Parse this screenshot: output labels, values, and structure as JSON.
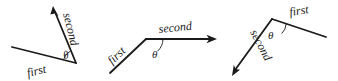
{
  "figure": {
    "stroke_color": "#1a1a1a",
    "background_color": "#ffffff",
    "label_first": "first",
    "label_second": "second",
    "label_theta": "θ"
  },
  "diagrams": [
    {
      "id": "left",
      "name": "acute-angle-opening-counterclockwise",
      "vertex": [
        76,
        63
      ],
      "first_arm_end": [
        12,
        47
      ],
      "second_arm_end": [
        53,
        7
      ],
      "second_has_arrow": true,
      "first_has_arrow": false,
      "first_label": "first",
      "second_label": "second",
      "theta_label": "θ",
      "first_label_rotation": -14,
      "second_label_rotation": -76,
      "theta_position": [
        64,
        57
      ]
    },
    {
      "id": "middle",
      "name": "obtuse-angle-opening-right",
      "vertex": [
        146,
        39
      ],
      "first_arm_end": [
        110,
        73
      ],
      "second_arm_end": [
        216,
        39
      ],
      "second_has_arrow": true,
      "first_has_arrow": false,
      "first_label": "first",
      "second_label": "second",
      "theta_label": "θ",
      "first_label_rotation": -43,
      "second_label_rotation": -6,
      "theta_position": [
        155,
        55
      ]
    },
    {
      "id": "right",
      "name": "obtuse-angle-opening-downward",
      "vertex": [
        272,
        19
      ],
      "first_arm_end": [
        326,
        37
      ],
      "second_arm_end": [
        233,
        75
      ],
      "second_has_arrow": true,
      "first_has_arrow": false,
      "first_label": "first",
      "second_label": "second",
      "theta_label": "θ",
      "first_label_rotation": -9,
      "second_label_rotation": -63,
      "theta_position": [
        272,
        36
      ]
    }
  ]
}
